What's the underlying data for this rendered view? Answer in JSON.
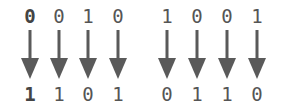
{
  "diagram": {
    "arrow_color": "#5a5a5a",
    "groups": [
      {
        "input": [
          "0",
          "0",
          "1",
          "0"
        ],
        "output": [
          "1",
          "1",
          "0",
          "1"
        ]
      },
      {
        "input": [
          "1",
          "0",
          "0",
          "1"
        ],
        "output": [
          "0",
          "1",
          "1",
          "0"
        ]
      }
    ],
    "columns": [
      {
        "top": "0",
        "bottom": "1",
        "bold": true
      },
      {
        "top": "0",
        "bottom": "1",
        "bold": false
      },
      {
        "top": "1",
        "bottom": "0",
        "bold": false
      },
      {
        "top": "0",
        "bottom": "1",
        "bold": false
      },
      {
        "top": "1",
        "bottom": "0",
        "bold": false
      },
      {
        "top": "0",
        "bottom": "1",
        "bold": false
      },
      {
        "top": "0",
        "bottom": "1",
        "bold": false
      },
      {
        "top": "1",
        "bottom": "0",
        "bold": false
      }
    ]
  }
}
